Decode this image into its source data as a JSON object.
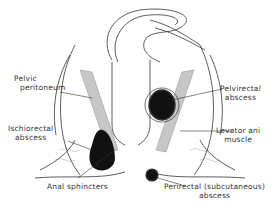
{
  "diagram": {
    "type": "anatomical-cross-section",
    "labels": {
      "pelvic_peritoneum": [
        "Pelvic",
        "peritoneum"
      ],
      "ischiorectal_abscess": [
        "Ischiorectal",
        "abscess"
      ],
      "anal_sphincters": [
        "Anal sphincters"
      ],
      "pelvirectal_abscess": [
        "Pelvirectal",
        "abscess"
      ],
      "levator_ani_muscle": [
        "Levator ani",
        "muscle"
      ],
      "perirectal_abscess": [
        "Perirectal (subcutaneous)",
        "abscess"
      ]
    },
    "colors": {
      "line": "#333333",
      "abscess_fill": "#111111",
      "muscle_shade": "#9a9a9a",
      "background": "#ffffff"
    }
  }
}
